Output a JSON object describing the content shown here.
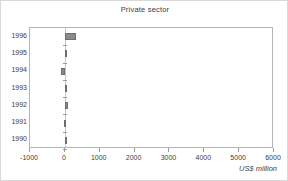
{
  "chart_data": {
    "type": "bar",
    "orientation": "horizontal",
    "title": "Private sector",
    "xlabel": "US$ million",
    "ylabel": "",
    "categories": [
      "1996",
      "1995",
      "1994",
      "1993",
      "1992",
      "1991",
      "1990"
    ],
    "values": [
      310,
      70,
      -120,
      30,
      90,
      -15,
      20
    ],
    "xlim": [
      -1000,
      6000
    ],
    "xticks": [
      -1000,
      0,
      1000,
      2000,
      3000,
      4000,
      5000,
      6000
    ],
    "xticklabels": [
      "-1000",
      "0",
      "1000",
      "2000",
      "3000",
      "4000",
      "5000",
      "6000"
    ],
    "grid": false,
    "legend": false,
    "bar_color": "#8a8a8a",
    "frame_color": "#b5b5b5",
    "text_color": "#3d3d3d"
  }
}
